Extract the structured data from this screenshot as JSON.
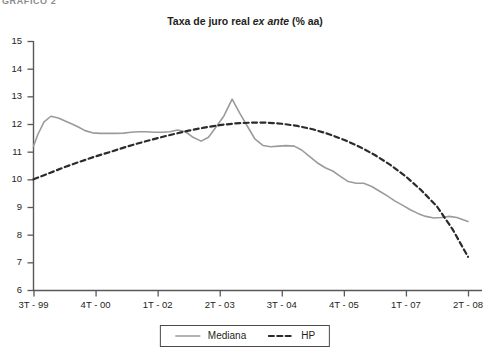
{
  "figure_label": "GRÁFICO 2",
  "chart_data": {
    "type": "line",
    "title": "Taxa de juro real ex ante (% aa)",
    "title_plain": "Taxa de juro real ",
    "title_italic": "ex ante",
    "title_tail": " (% aa)",
    "xlabel": "",
    "ylabel": "",
    "ylim": [
      6,
      15
    ],
    "yticks": [
      15,
      14,
      13,
      12,
      11,
      10,
      9,
      8,
      7,
      6
    ],
    "xtick_labels": [
      "3T - 99",
      "4T - 00",
      "1T - 02",
      "2T - 03",
      "3T - 04",
      "4T - 05",
      "1T - 07",
      "2T - 08"
    ],
    "grid": false,
    "legend_position": "bottom-center",
    "series": [
      {
        "name": "Mediana",
        "style": "solid",
        "color": "#9b9b9b",
        "x": [
          0,
          0.07,
          0.17,
          0.28,
          0.4,
          0.5,
          0.62,
          0.73,
          0.83,
          0.95,
          1.07,
          1.2,
          1.32,
          1.45,
          1.57,
          1.7,
          1.82,
          1.95,
          2.07,
          2.2,
          2.32,
          2.45,
          2.57,
          2.7,
          2.82,
          2.95,
          3.07,
          3.2,
          3.32,
          3.45,
          3.57,
          3.7,
          3.82,
          3.95,
          4.07,
          4.2,
          4.32,
          4.45,
          4.57,
          4.7,
          4.82,
          4.95,
          5.07,
          5.2,
          5.32,
          5.45,
          5.57,
          5.7,
          5.82,
          5.95,
          6.07,
          6.2,
          6.32,
          6.45,
          6.57,
          6.7,
          6.82,
          7.0
        ],
        "values": [
          11.2,
          11.62,
          12.08,
          12.28,
          12.22,
          12.12,
          12.0,
          11.88,
          11.76,
          11.68,
          11.66,
          11.66,
          11.66,
          11.67,
          11.7,
          11.72,
          11.72,
          11.7,
          11.7,
          11.72,
          11.78,
          11.72,
          11.52,
          11.38,
          11.52,
          11.92,
          12.3,
          12.9,
          12.4,
          11.9,
          11.45,
          11.22,
          11.18,
          11.2,
          11.22,
          11.2,
          11.06,
          10.82,
          10.6,
          10.42,
          10.3,
          10.1,
          9.92,
          9.86,
          9.86,
          9.74,
          9.58,
          9.4,
          9.22,
          9.06,
          8.9,
          8.76,
          8.66,
          8.6,
          8.62,
          8.66,
          8.62,
          8.48
        ]
      },
      {
        "name": "HP",
        "style": "dashed",
        "color": "#2b2b2b",
        "x": [
          0,
          0.25,
          0.5,
          0.75,
          1.0,
          1.25,
          1.5,
          1.75,
          2.0,
          2.25,
          2.5,
          2.75,
          3.0,
          3.25,
          3.5,
          3.75,
          4.0,
          4.25,
          4.5,
          4.75,
          5.0,
          5.25,
          5.5,
          5.75,
          6.0,
          6.25,
          6.5,
          6.75,
          7.0
        ],
        "values": [
          10.0,
          10.22,
          10.44,
          10.64,
          10.83,
          11.0,
          11.18,
          11.34,
          11.49,
          11.63,
          11.76,
          11.87,
          11.96,
          12.02,
          12.05,
          12.05,
          12.01,
          11.93,
          11.81,
          11.64,
          11.43,
          11.18,
          10.88,
          10.52,
          10.1,
          9.6,
          9.02,
          8.2,
          7.2
        ]
      }
    ],
    "annotations": []
  },
  "legend": {
    "entries": [
      {
        "label": "Mediana",
        "style": "solid",
        "color": "#9b9b9b"
      },
      {
        "label": "HP",
        "style": "dashed",
        "color": "#2b2b2b"
      }
    ]
  }
}
